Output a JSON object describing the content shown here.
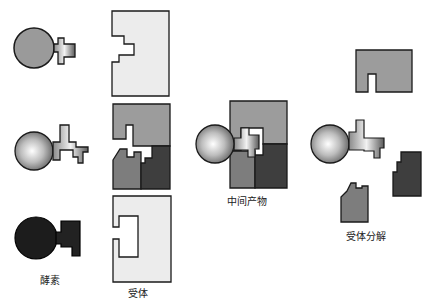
{
  "diagram": {
    "type": "enzyme-substrate mechanism (lock and key)",
    "labels": {
      "enzyme": "酵素",
      "substrate": "受体",
      "intermediate": "中间产物",
      "substrate_split": "受体分解"
    },
    "colors": {
      "outline": "#1a1a1a",
      "enzyme_gray": "#9a9a9a",
      "enzyme_dark": "#1c1c1c",
      "substrate_light": "#ececec",
      "piece_top": "#9c9c9c",
      "piece_left": "#7d7d7d",
      "piece_right": "#3e3e3e"
    }
  }
}
